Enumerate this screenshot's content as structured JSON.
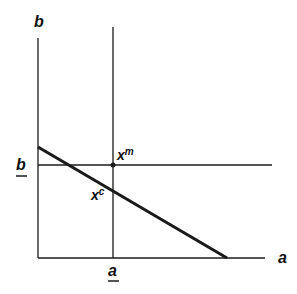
{
  "diagram": {
    "axes": {
      "y_label": "b",
      "x_label": "a"
    },
    "thresholds": {
      "a_bar_label": "a",
      "b_bar_label": "b"
    },
    "points": {
      "xm_base": "x",
      "xm_sup": "m",
      "xc_base": "x",
      "xc_sup": "c"
    },
    "colors": {
      "line": "#1a1a1a",
      "background": "#ffffff"
    }
  }
}
